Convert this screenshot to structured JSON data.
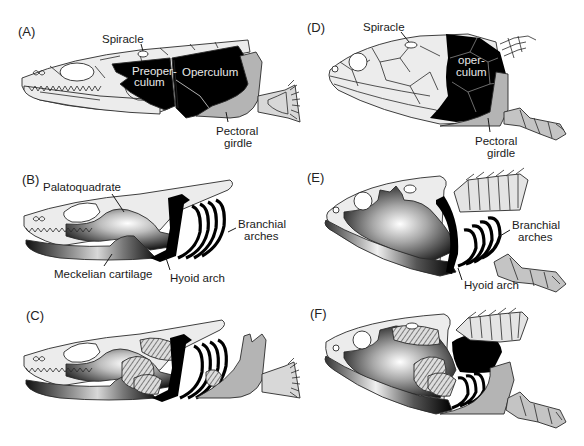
{
  "figure": {
    "panels": [
      {
        "id": "A",
        "letter": "(A)",
        "labels": {
          "spiracle": "Spiracle",
          "preoperculum_1": "Preoper-",
          "preoperculum_2": "culum",
          "operculum": "Operculum",
          "pectoral_1": "Pectoral",
          "pectoral_2": "girdle"
        }
      },
      {
        "id": "B",
        "letter": "(B)",
        "labels": {
          "palatoquadrate": "Palatoquadrate",
          "meckelian": "Meckelian cartilage",
          "hyoid": "Hyoid arch",
          "branchial_1": "Branchial",
          "branchial_2": "arches"
        }
      },
      {
        "id": "C",
        "letter": "(C)",
        "labels": {}
      },
      {
        "id": "D",
        "letter": "(D)",
        "labels": {
          "spiracle": "Spiracle",
          "operculum_1": "oper-",
          "operculum_2": "culum",
          "pectoral_1": "Pectoral",
          "pectoral_2": "girdle"
        }
      },
      {
        "id": "E",
        "letter": "(E)",
        "labels": {
          "branchial_1": "Branchial",
          "branchial_2": "arches",
          "hyoid": "Hyoid arch"
        }
      },
      {
        "id": "F",
        "letter": "(F)",
        "labels": {}
      }
    ],
    "colors": {
      "bone_fill": "#ececec",
      "dermal_black": "#000000",
      "girdle_gray": "#b4b4b4",
      "outline": "#2a2a2a",
      "background": "#ffffff"
    }
  }
}
